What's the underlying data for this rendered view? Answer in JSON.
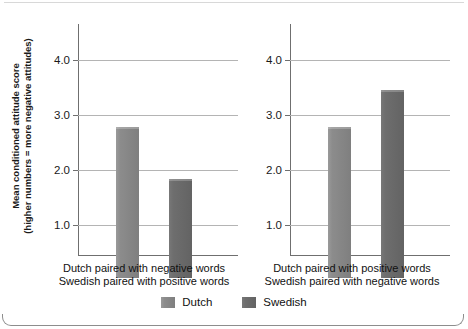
{
  "chart_data": {
    "type": "bar",
    "title": "",
    "xlabel": "",
    "ylabel_line1": "Mean conditioned attitude score",
    "ylabel_line2": "(higher numbers = more negative attitudes)",
    "ylim": [
      0,
      4.6
    ],
    "yticks": [
      "1.0",
      "2.0",
      "3.0",
      "4.0"
    ],
    "ytick_values": [
      1.0,
      2.0,
      3.0,
      4.0
    ],
    "grid": "horizontal",
    "legend_position": "bottom-center",
    "categories": [
      "Dutch",
      "Swedish"
    ],
    "panels": [
      {
        "caption_line1": "Dutch paired with negative words",
        "caption_line2": "Swedish paired with positive words",
        "series": [
          {
            "name": "Dutch",
            "value": 2.75,
            "color": "#8c8c8c"
          },
          {
            "name": "Swedish",
            "value": 1.8,
            "color": "#6e6e6e"
          }
        ]
      },
      {
        "caption_line1": "Dutch paired with positive words",
        "caption_line2": "Swedish paired with negative words",
        "series": [
          {
            "name": "Dutch",
            "value": 2.75,
            "color": "#8c8c8c"
          },
          {
            "name": "Swedish",
            "value": 3.42,
            "color": "#6e6e6e"
          }
        ]
      }
    ],
    "legend": [
      {
        "label": "Dutch",
        "color": "#8c8c8c"
      },
      {
        "label": "Swedish",
        "color": "#6e6e6e"
      }
    ]
  }
}
